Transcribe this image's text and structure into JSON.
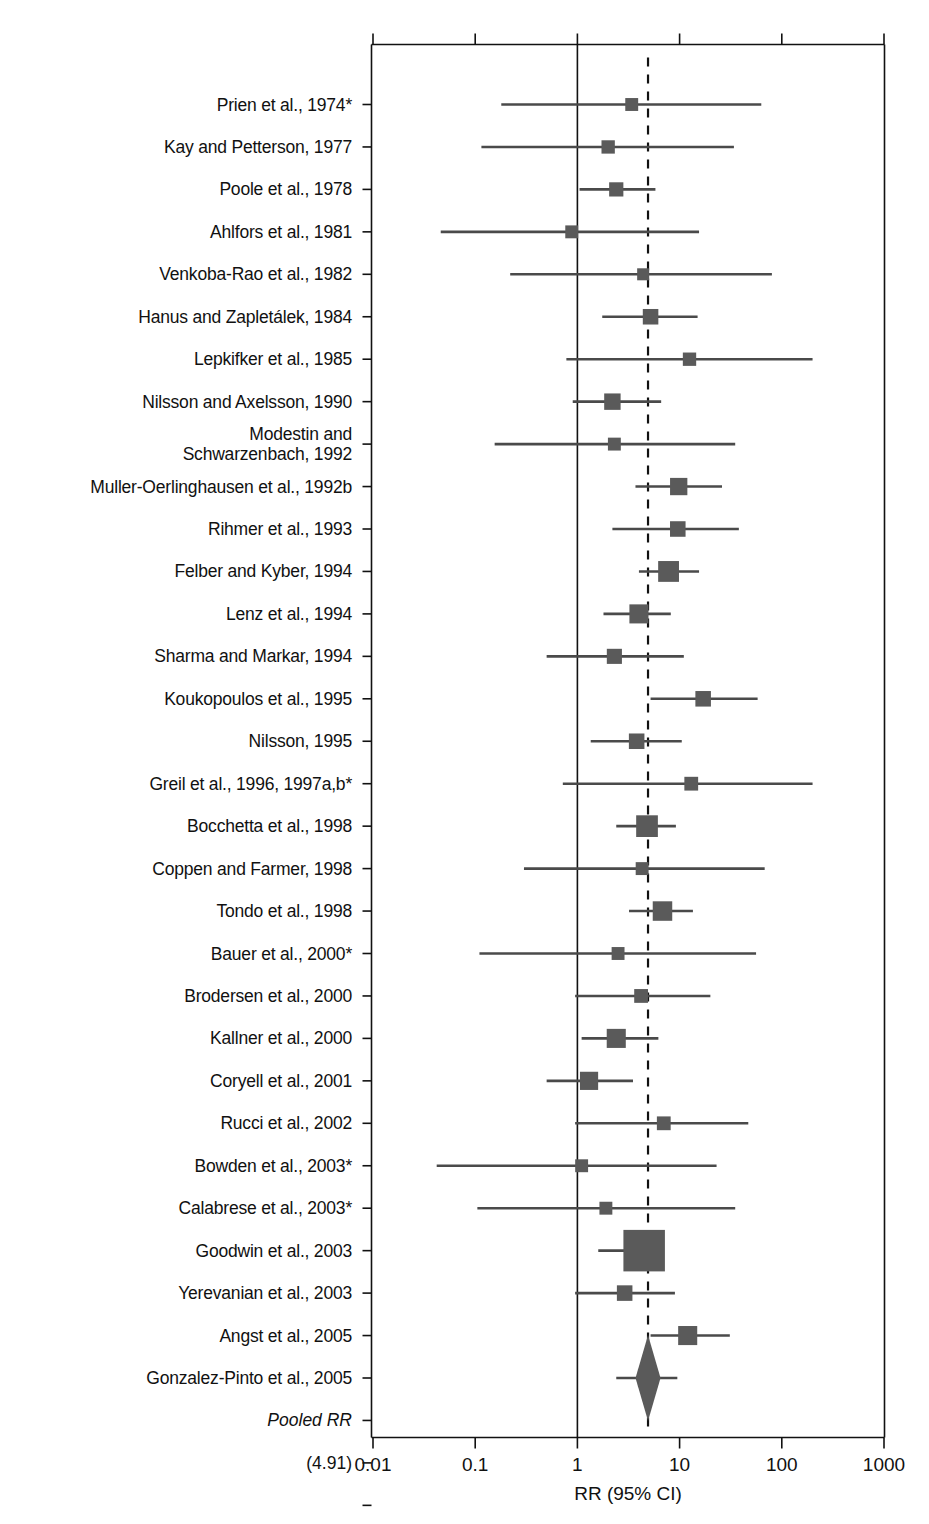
{
  "figure": {
    "type": "forest-plot",
    "background": "#ffffff",
    "marker_color": "#5a5a5a",
    "line_color": "#4a4a4a",
    "axis_color": "#111111"
  },
  "axis": {
    "x_title": "RR (95% CI)",
    "scale": "log10",
    "tick_labels": [
      "0.01",
      "0.1",
      "1",
      "10",
      "100",
      "1000"
    ],
    "tick_values": [
      0.01,
      0.1,
      1,
      10,
      100,
      1000
    ],
    "xlim": [
      0.01,
      1000
    ],
    "reference_line_value": 1,
    "pooled_line_value": 4.91,
    "pooled_line_style": "dashed"
  },
  "pooled": {
    "label": "Pooled RR",
    "value_label": "(4.91)",
    "rr": 4.91
  },
  "chart_data": {
    "type": "forest",
    "title": "",
    "xlabel": "RR (95% CI)",
    "ylabel": "",
    "xscale": "log",
    "xlim": [
      0.01,
      1000
    ],
    "grid": false,
    "reference_line": 1,
    "pooled_reference_line": 4.91,
    "tick_labels": [
      "0.01",
      "0.1",
      "1",
      "10",
      "100",
      "1000"
    ],
    "studies": [
      {
        "label": "Prien et al., 1974*",
        "rr": 3.4,
        "lo": 0.18,
        "hi": 63.0,
        "weight": 1.0
      },
      {
        "label": "Kay and Petterson, 1977",
        "rr": 2.0,
        "lo": 0.115,
        "hi": 34.0,
        "weight": 1.1
      },
      {
        "label": "Poole et al., 1978",
        "rr": 2.4,
        "lo": 1.05,
        "hi": 5.8,
        "weight": 1.3
      },
      {
        "label": "Ahlfors et al., 1981",
        "rr": 0.88,
        "lo": 0.046,
        "hi": 15.5,
        "weight": 1.0
      },
      {
        "label": "Venkoba-Rao et al., 1982",
        "rr": 4.4,
        "lo": 0.22,
        "hi": 80.0,
        "weight": 0.8
      },
      {
        "label": "Hanus and Zapletálek, 1984",
        "rr": 5.2,
        "lo": 1.75,
        "hi": 15.0,
        "weight": 1.6
      },
      {
        "label": "Lepkifker et al., 1985",
        "rr": 12.5,
        "lo": 0.78,
        "hi": 200.0,
        "weight": 1.1
      },
      {
        "label": "Nilsson and Axelsson, 1990",
        "rr": 2.2,
        "lo": 0.9,
        "hi": 6.6,
        "weight": 1.8
      },
      {
        "label": "Modestin and\nSchwarzenbach, 1992",
        "rr": 2.3,
        "lo": 0.155,
        "hi": 35.0,
        "weight": 1.0
      },
      {
        "label": "Muller-Oerlinghausen et al., 1992b",
        "rr": 9.8,
        "lo": 3.7,
        "hi": 26.0,
        "weight": 2.0
      },
      {
        "label": "Rihmer et al., 1993",
        "rr": 9.6,
        "lo": 2.2,
        "hi": 38.0,
        "weight": 1.6
      },
      {
        "label": "Felber and Kyber, 1994",
        "rr": 7.8,
        "lo": 4.0,
        "hi": 15.5,
        "weight": 2.8
      },
      {
        "label": "Lenz et al., 1994",
        "rr": 4.0,
        "lo": 1.8,
        "hi": 8.2,
        "weight": 2.4
      },
      {
        "label": "Sharma and Markar, 1994",
        "rr": 2.3,
        "lo": 0.5,
        "hi": 11.0,
        "weight": 1.5
      },
      {
        "label": "Koukopoulos et al., 1995",
        "rr": 17.0,
        "lo": 5.2,
        "hi": 58.0,
        "weight": 1.6
      },
      {
        "label": "Nilsson, 1995",
        "rr": 3.8,
        "lo": 1.35,
        "hi": 10.5,
        "weight": 1.6
      },
      {
        "label": "Greil et al., 1996, 1997a,b*",
        "rr": 13.0,
        "lo": 0.72,
        "hi": 200.0,
        "weight": 1.2
      },
      {
        "label": "Bocchetta et al., 1998",
        "rr": 4.8,
        "lo": 2.4,
        "hi": 9.2,
        "weight": 3.0
      },
      {
        "label": "Coppen and Farmer, 1998",
        "rr": 4.3,
        "lo": 0.3,
        "hi": 68.0,
        "weight": 1.0
      },
      {
        "label": "Tondo et al., 1998",
        "rr": 6.8,
        "lo": 3.2,
        "hi": 13.5,
        "weight": 2.5
      },
      {
        "label": "Bauer et al., 2000*",
        "rr": 2.5,
        "lo": 0.11,
        "hi": 56.0,
        "weight": 1.0
      },
      {
        "label": "Brodersen et al., 2000",
        "rr": 4.2,
        "lo": 0.95,
        "hi": 20.0,
        "weight": 1.2
      },
      {
        "label": "Kallner et al., 2000",
        "rr": 2.4,
        "lo": 1.1,
        "hi": 6.2,
        "weight": 2.4
      },
      {
        "label": "Coryell et al., 2001",
        "rr": 1.3,
        "lo": 0.5,
        "hi": 3.5,
        "weight": 2.2
      },
      {
        "label": "Rucci et al., 2002",
        "rr": 7.0,
        "lo": 0.95,
        "hi": 47.0,
        "weight": 1.2
      },
      {
        "label": "Bowden et al., 2003*",
        "rr": 1.1,
        "lo": 0.042,
        "hi": 23.0,
        "weight": 1.0
      },
      {
        "label": "Calabrese et al., 2003*",
        "rr": 1.9,
        "lo": 0.105,
        "hi": 35.0,
        "weight": 1.0
      },
      {
        "label": "Goodwin et al., 2003",
        "rr": 4.5,
        "lo": 1.6,
        "hi": 5.0,
        "weight": 7.5
      },
      {
        "label": "Yerevanian et al., 2003",
        "rr": 2.9,
        "lo": 0.95,
        "hi": 9.0,
        "weight": 1.6
      },
      {
        "label": "Angst et al., 2005",
        "rr": 12.0,
        "lo": 5.2,
        "hi": 31.0,
        "weight": 2.4
      },
      {
        "label": "Gonzalez-Pinto et al., 2005",
        "rr": 4.8,
        "lo": 2.4,
        "hi": 9.5,
        "weight": 2.2
      }
    ],
    "pooled": {
      "label": "Pooled RR",
      "value_label": "(4.91)",
      "rr": 4.91,
      "lo": 4.2,
      "hi": 5.7
    }
  }
}
